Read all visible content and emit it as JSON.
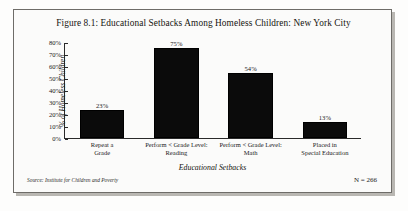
{
  "figure": {
    "title": "Figure 8.1: Educational Setbacks Among Homeless Children: New York City",
    "source_note": "Source: Institute for Children and Poverty",
    "n_note": "N = 266"
  },
  "chart_data": {
    "type": "bar",
    "title": "Figure 8.1: Educational Setbacks Among Homeless Children: New York City",
    "xlabel": "Educational Setbacks",
    "ylabel": "% of Homeless Children",
    "categories": [
      "Repeat a\nGrade",
      "Perform < Grade Level:\nReading",
      "Perform < Grade Level:\nMath",
      "Placed in\nSpecial Education"
    ],
    "category_lines": [
      [
        "Repeat a",
        "Grade"
      ],
      [
        "Perform < Grade Level:",
        "Reading"
      ],
      [
        "Perform < Grade Level:",
        "Math"
      ],
      [
        "Placed in",
        "Special Education"
      ]
    ],
    "values": [
      23,
      75,
      54,
      13
    ],
    "value_labels": [
      "23%",
      "75%",
      "54%",
      "13%"
    ],
    "ylim": [
      0,
      80
    ],
    "ytick_labels": [
      "80%",
      "70%",
      "60%",
      "50%",
      "40%",
      "30%",
      "20%",
      "10%",
      "0%"
    ],
    "ytick_values": [
      80,
      70,
      60,
      50,
      40,
      30,
      20,
      10,
      0
    ],
    "grid": false,
    "legend": false,
    "bar_color": "#0b0b0b",
    "axis_color": "#2a2a2a"
  }
}
